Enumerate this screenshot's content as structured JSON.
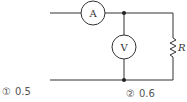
{
  "diagram": {
    "type": "circuit",
    "ammeter": {
      "label": "A"
    },
    "voltmeter": {
      "label": "V"
    },
    "resistor": {
      "label": "R"
    },
    "stroke_color": "#333333"
  },
  "choices": [
    {
      "marker": "①",
      "value": "0.5"
    },
    {
      "marker": "②",
      "value": "0.6"
    }
  ]
}
